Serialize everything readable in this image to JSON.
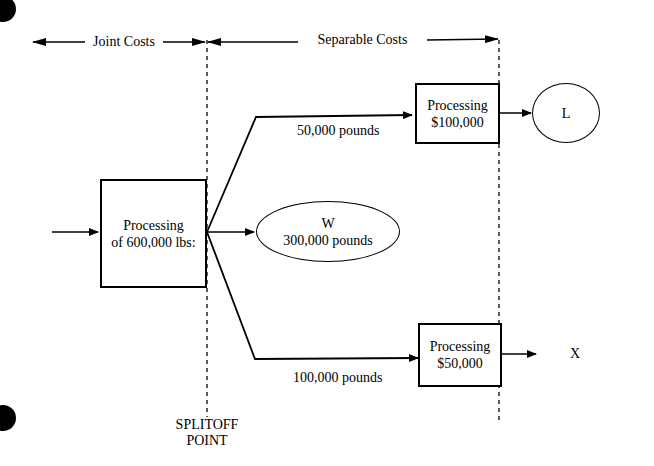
{
  "header": {
    "joint_costs": "Joint Costs",
    "separable_costs": "Separable Costs"
  },
  "joint_process": {
    "line1": "Processing",
    "line2": "of 600,000 lbs:"
  },
  "splitoff": {
    "line1": "SPLITOFF",
    "line2": "POINT"
  },
  "products": {
    "L": {
      "flow_label": "50,000 pounds",
      "process_line1": "Processing",
      "process_line2": "$100,000",
      "name": "L"
    },
    "W": {
      "name": "W",
      "quantity": "300,000 pounds"
    },
    "X": {
      "flow_label": "100,000 pounds",
      "process_line1": "Processing",
      "process_line2": "$50,000",
      "name": "X"
    }
  }
}
